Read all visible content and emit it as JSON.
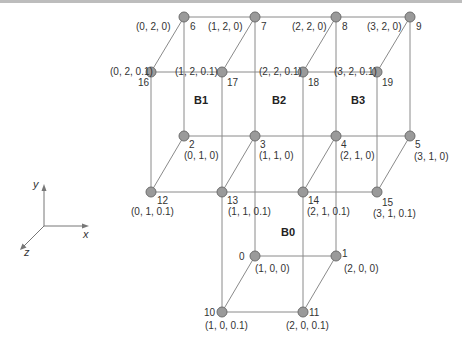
{
  "diagram": {
    "title": "",
    "axes": {
      "x": "x",
      "y": "y",
      "z": "z"
    },
    "blocks": [
      {
        "id": "B0",
        "label": "B0",
        "x": 281,
        "y": 236
      },
      {
        "id": "B1",
        "label": "B1",
        "x": 201,
        "y": 104
      },
      {
        "id": "B2",
        "label": "B2",
        "x": 279,
        "y": 104
      },
      {
        "id": "B3",
        "label": "B3",
        "x": 357,
        "y": 104
      }
    ],
    "nodes": [
      {
        "id": "0",
        "coord": "(1, 0, 0)",
        "x": 255,
        "y": 256
      },
      {
        "id": "1",
        "coord": "(2, 0, 0)",
        "x": 336,
        "y": 256
      },
      {
        "id": "2",
        "coord": "(0, 1, 0)",
        "x": 184,
        "y": 136
      },
      {
        "id": "3",
        "coord": "(1, 1, 0)",
        "x": 255,
        "y": 136
      },
      {
        "id": "4",
        "coord": "(2, 1, 0)",
        "x": 336,
        "y": 136
      },
      {
        "id": "5",
        "coord": "(3, 1, 0)",
        "x": 410,
        "y": 136
      },
      {
        "id": "6",
        "coord": "(0, 2, 0)",
        "x": 184,
        "y": 17
      },
      {
        "id": "7",
        "coord": "(1, 2, 0)",
        "x": 255,
        "y": 17
      },
      {
        "id": "8",
        "coord": "(2, 2, 0)",
        "x": 336,
        "y": 17
      },
      {
        "id": "9",
        "coord": "(3, 2, 0)",
        "x": 410,
        "y": 17
      },
      {
        "id": "10",
        "coord": "(1, 0, 0.1)",
        "x": 222,
        "y": 312
      },
      {
        "id": "11",
        "coord": "(2, 0, 0.1)",
        "x": 303,
        "y": 312
      },
      {
        "id": "12",
        "coord": "(0, 1, 0.1)",
        "x": 151,
        "y": 192
      },
      {
        "id": "13",
        "coord": "(1, 1, 0.1)",
        "x": 222,
        "y": 192
      },
      {
        "id": "14",
        "coord": "(2, 1, 0.1)",
        "x": 303,
        "y": 192
      },
      {
        "id": "15",
        "coord": "(3, 1, 0.1)",
        "x": 377,
        "y": 192
      },
      {
        "id": "16",
        "coord": "(0, 2, 0.1)",
        "x": 151,
        "y": 72
      },
      {
        "id": "17",
        "coord": "(1, 2, 0.1)",
        "x": 222,
        "y": 72
      },
      {
        "id": "18",
        "coord": "(2, 2, 0.1)",
        "x": 303,
        "y": 72
      },
      {
        "id": "19",
        "coord": "(3, 2, 0.1)",
        "x": 377,
        "y": 72
      }
    ]
  }
}
